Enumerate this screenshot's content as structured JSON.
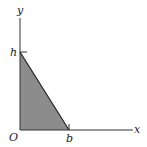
{
  "diagram": {
    "type": "geometry",
    "axes": {
      "x_label": "x",
      "y_label": "y",
      "origin_label": "O"
    },
    "points": {
      "h_label": "h",
      "b_label": "b"
    },
    "triangle": {
      "vertices": [
        "O",
        "h",
        "b"
      ],
      "fill": "#8c8c8c",
      "stroke": "#222222"
    },
    "colors": {
      "axis": "#333333",
      "shade": "#8c8c8c"
    }
  }
}
